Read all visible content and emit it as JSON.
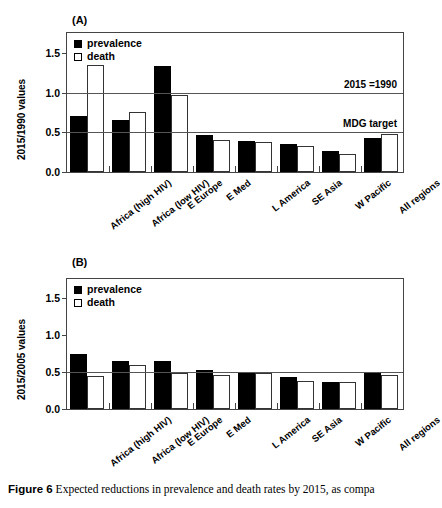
{
  "figure": {
    "caption_label": "Figure 6",
    "caption_text": "Expected reductions in prevalence and death rates by 2015, as compa"
  },
  "legend": {
    "prevalence_label": "prevalence",
    "death_label": "death",
    "prevalence_color": "#000000",
    "death_color": "#ffffff"
  },
  "panel_a": {
    "label": "(A)",
    "ylabel": "2015/1990 values",
    "annotation_equal": "2015 =1990",
    "annotation_mdg": "MDG target"
  },
  "panel_b": {
    "label": "(B)",
    "ylabel": "2015/2005 values"
  },
  "chart_data": [
    {
      "type": "bar",
      "panel": "(A)",
      "title": "",
      "xlabel": "",
      "ylabel": "2015/1990 values",
      "ylim": [
        0.0,
        1.75
      ],
      "yticks": [
        0.0,
        0.5,
        1.0,
        1.5
      ],
      "ytick_labels": [
        "0.0",
        "0.5",
        "1.0",
        "1.5"
      ],
      "grid": true,
      "legend_position": "top-left",
      "categories": [
        "Africa (high HIV)",
        "Africa (low HIV)",
        "E Europe",
        "E Med",
        "L America",
        "SE Asia",
        "W Pacific",
        "All regions"
      ],
      "series": [
        {
          "name": "prevalence",
          "values": [
            0.7,
            0.66,
            1.33,
            0.47,
            0.39,
            0.35,
            0.27,
            0.43
          ]
        },
        {
          "name": "death",
          "values": [
            1.35,
            0.75,
            0.97,
            0.4,
            0.38,
            0.33,
            0.23,
            0.48
          ]
        }
      ],
      "reference_lines": [
        {
          "value": 1.0,
          "label": "2015 =1990"
        },
        {
          "value": 0.5,
          "label": "MDG target"
        }
      ]
    },
    {
      "type": "bar",
      "panel": "(B)",
      "title": "",
      "xlabel": "",
      "ylabel": "2015/2005 values",
      "ylim": [
        0.0,
        1.75
      ],
      "yticks": [
        0.0,
        0.5,
        1.0,
        1.5
      ],
      "ytick_labels": [
        "0.0",
        "0.5",
        "1.0",
        "1.5"
      ],
      "grid": true,
      "legend_position": "top-left",
      "categories": [
        "Africa (high HIV)",
        "Africa (low HIV)",
        "E Europe",
        "E Med",
        "L America",
        "SE Asia",
        "W Pacific",
        "All regions"
      ],
      "series": [
        {
          "name": "prevalence",
          "values": [
            0.74,
            0.64,
            0.64,
            0.52,
            0.5,
            0.43,
            0.37,
            0.48
          ]
        },
        {
          "name": "death",
          "values": [
            0.45,
            0.59,
            0.48,
            0.46,
            0.49,
            0.38,
            0.36,
            0.46
          ]
        }
      ],
      "reference_lines": [
        {
          "value": 0.5,
          "label": ""
        }
      ]
    }
  ]
}
